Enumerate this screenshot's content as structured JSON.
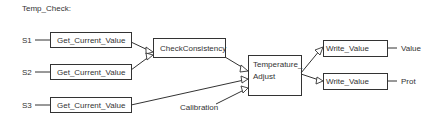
{
  "diagram": {
    "title": "Temp_Check:",
    "inputs": [
      {
        "id": "s1",
        "label": "S1"
      },
      {
        "id": "s2",
        "label": "S2"
      },
      {
        "id": "s3",
        "label": "S3"
      }
    ],
    "blocks": {
      "get1": "Get_Current_Value",
      "get2": "Get_Current_Value",
      "get3": "Get_Current_Value",
      "check": "CheckConsistency",
      "temp_line1": "Temperature_",
      "temp_line2": "Adjust",
      "write1": "Write_Value",
      "write2": "Write_Value"
    },
    "extra_input": "Calibration",
    "outputs": [
      {
        "id": "value",
        "label": "Value"
      },
      {
        "id": "prot",
        "label": "Prot"
      }
    ],
    "colors": {
      "stroke": "#333333",
      "background": "#ffffff"
    }
  }
}
